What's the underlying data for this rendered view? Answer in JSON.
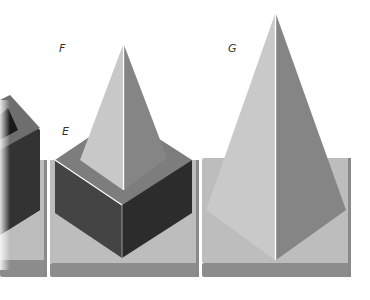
{
  "figure": {
    "labels": {
      "E": "E",
      "F": "F",
      "G": "G"
    },
    "panels": [
      {
        "id": "left-partial",
        "shape": "cube",
        "cropped": true
      },
      {
        "id": "middle",
        "shape": "cube-with-pyramid",
        "labels": [
          "E",
          "F"
        ]
      },
      {
        "id": "right",
        "shape": "pyramid",
        "labels": [
          "G"
        ]
      }
    ],
    "colors": {
      "background": "#ffffff",
      "base_top": "#bdbdbd",
      "base_front": "#8c8c8c",
      "face_light": "#c8c8c8",
      "face_mid": "#8a8a8a",
      "face_dark": "#3a3a3a",
      "face_darker": "#2a2a2a",
      "cube_top": "#7d7d7d",
      "edge_highlight": "#ffffff",
      "label_text": "#333333"
    }
  }
}
